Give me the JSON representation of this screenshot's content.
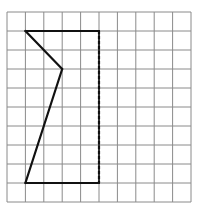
{
  "grid": {
    "columns": 10,
    "rows": 10,
    "origin_x": 7,
    "origin_y": 12,
    "cell_width": 18.4,
    "cell_height": 19,
    "line_color": "#8a8a8a",
    "line_width": 1
  },
  "figure": {
    "stroke_color": "#111111",
    "stroke_width": 2.2,
    "segments": [
      {
        "id": "top-edge",
        "from": [
          1,
          1
        ],
        "to": [
          5,
          1
        ],
        "style": "solid"
      },
      {
        "id": "right-edge",
        "from": [
          5,
          1
        ],
        "to": [
          5,
          9
        ],
        "style": "dashed"
      },
      {
        "id": "bottom-edge",
        "from": [
          5,
          9
        ],
        "to": [
          1,
          9
        ],
        "style": "solid"
      },
      {
        "id": "lower-diagonal",
        "from": [
          1,
          9
        ],
        "to": [
          3,
          3
        ],
        "style": "solid"
      },
      {
        "id": "upper-diagonal",
        "from": [
          3,
          3
        ],
        "to": [
          1,
          1
        ],
        "style": "solid"
      }
    ],
    "dash_pattern": "3,2"
  }
}
